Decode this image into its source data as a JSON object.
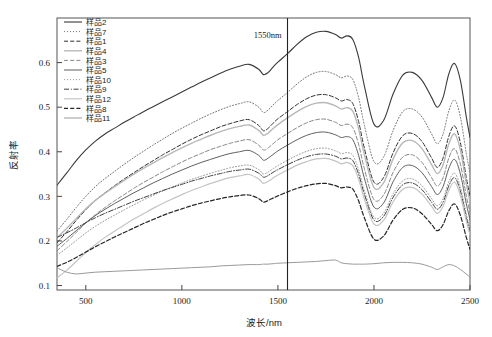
{
  "chart_data": {
    "type": "line",
    "title": "",
    "xlabel": "波长/nm",
    "ylabel": "反射率",
    "xlim": [
      350,
      2500
    ],
    "ylim": [
      0.09,
      0.7
    ],
    "xticks": [
      500,
      1000,
      1500,
      2000,
      2500
    ],
    "xtick_labels": [
      "500",
      "1000",
      "1500",
      "2000",
      "2500"
    ],
    "yticks": [
      0.1,
      0.2,
      0.3,
      0.4,
      0.5,
      0.6
    ],
    "ytick_labels": [
      "0.1",
      "0.2",
      "0.3",
      "0.4",
      "0.5",
      "0.6"
    ],
    "grid": false,
    "legend_position": "top-left",
    "annotations": [
      {
        "text": "1550nm",
        "x": 1550,
        "y": 0.655,
        "type": "vline-label"
      }
    ],
    "vlines": [
      {
        "x": 1550,
        "color": "#222222",
        "width": 1.1
      }
    ],
    "x": [
      350,
      400,
      450,
      500,
      550,
      600,
      650,
      700,
      750,
      800,
      850,
      900,
      950,
      1000,
      1050,
      1100,
      1150,
      1200,
      1250,
      1300,
      1350,
      1400,
      1425,
      1450,
      1475,
      1500,
      1550,
      1600,
      1650,
      1700,
      1750,
      1800,
      1830,
      1860,
      1890,
      1920,
      1950,
      2000,
      2050,
      2100,
      2150,
      2200,
      2250,
      2300,
      2330,
      2360,
      2390,
      2420,
      2450,
      2480,
      2500
    ],
    "series": [
      {
        "name": "样品2",
        "style": "solid",
        "color": "#3a3a3a",
        "width": 1.1,
        "values": [
          0.325,
          0.352,
          0.38,
          0.404,
          0.424,
          0.44,
          0.453,
          0.466,
          0.478,
          0.49,
          0.501,
          0.512,
          0.523,
          0.534,
          0.545,
          0.556,
          0.566,
          0.576,
          0.585,
          0.592,
          0.596,
          0.585,
          0.573,
          0.578,
          0.59,
          0.601,
          0.62,
          0.641,
          0.658,
          0.668,
          0.67,
          0.663,
          0.655,
          0.66,
          0.652,
          0.612,
          0.548,
          0.462,
          0.47,
          0.53,
          0.572,
          0.578,
          0.56,
          0.522,
          0.5,
          0.522,
          0.575,
          0.598,
          0.56,
          0.48,
          0.432
        ]
      },
      {
        "name": "样品7",
        "style": "dotted",
        "color": "#707070",
        "width": 1.0,
        "values": [
          0.222,
          0.248,
          0.275,
          0.3,
          0.322,
          0.34,
          0.356,
          0.372,
          0.387,
          0.401,
          0.415,
          0.428,
          0.441,
          0.453,
          0.464,
          0.475,
          0.485,
          0.494,
          0.502,
          0.508,
          0.512,
          0.5,
          0.488,
          0.494,
          0.505,
          0.515,
          0.533,
          0.552,
          0.568,
          0.578,
          0.58,
          0.573,
          0.566,
          0.57,
          0.562,
          0.522,
          0.46,
          0.378,
          0.388,
          0.448,
          0.49,
          0.496,
          0.478,
          0.44,
          0.418,
          0.44,
          0.492,
          0.516,
          0.478,
          0.398,
          0.352
        ]
      },
      {
        "name": "样品1",
        "style": "dashed",
        "color": "#2f2f2f",
        "width": 1.0,
        "values": [
          0.196,
          0.22,
          0.246,
          0.27,
          0.291,
          0.308,
          0.324,
          0.339,
          0.353,
          0.367,
          0.38,
          0.393,
          0.405,
          0.417,
          0.428,
          0.438,
          0.447,
          0.456,
          0.463,
          0.469,
          0.472,
          0.459,
          0.447,
          0.453,
          0.464,
          0.474,
          0.49,
          0.506,
          0.519,
          0.527,
          0.528,
          0.521,
          0.514,
          0.517,
          0.508,
          0.468,
          0.408,
          0.332,
          0.342,
          0.398,
          0.436,
          0.441,
          0.423,
          0.386,
          0.365,
          0.386,
          0.435,
          0.458,
          0.42,
          0.344,
          0.3
        ]
      },
      {
        "name": "样品4",
        "style": "light-solid",
        "color": "#b8b8b8",
        "width": 1.4,
        "values": [
          0.207,
          0.228,
          0.25,
          0.272,
          0.291,
          0.307,
          0.322,
          0.336,
          0.35,
          0.363,
          0.375,
          0.387,
          0.398,
          0.409,
          0.419,
          0.428,
          0.437,
          0.445,
          0.452,
          0.457,
          0.46,
          0.448,
          0.437,
          0.442,
          0.452,
          0.461,
          0.476,
          0.49,
          0.502,
          0.509,
          0.51,
          0.503,
          0.496,
          0.499,
          0.491,
          0.452,
          0.394,
          0.32,
          0.33,
          0.384,
          0.42,
          0.425,
          0.407,
          0.371,
          0.351,
          0.371,
          0.418,
          0.44,
          0.404,
          0.33,
          0.288
        ]
      },
      {
        "name": "样品3",
        "style": "dashed",
        "color": "#878787",
        "width": 1.0,
        "values": [
          0.178,
          0.198,
          0.219,
          0.24,
          0.259,
          0.275,
          0.29,
          0.304,
          0.318,
          0.331,
          0.343,
          0.355,
          0.366,
          0.377,
          0.387,
          0.396,
          0.405,
          0.412,
          0.419,
          0.424,
          0.427,
          0.415,
          0.404,
          0.409,
          0.418,
          0.427,
          0.441,
          0.454,
          0.465,
          0.472,
          0.473,
          0.466,
          0.459,
          0.462,
          0.454,
          0.417,
          0.362,
          0.293,
          0.303,
          0.354,
          0.388,
          0.393,
          0.376,
          0.342,
          0.323,
          0.342,
          0.386,
          0.407,
          0.372,
          0.303,
          0.264
        ]
      },
      {
        "name": "样品5",
        "style": "solid",
        "color": "#5f5f5f",
        "width": 1.0,
        "values": [
          0.188,
          0.205,
          0.223,
          0.241,
          0.257,
          0.271,
          0.284,
          0.296,
          0.308,
          0.319,
          0.33,
          0.34,
          0.35,
          0.359,
          0.368,
          0.376,
          0.383,
          0.39,
          0.396,
          0.4,
          0.403,
          0.392,
          0.381,
          0.386,
          0.394,
          0.402,
          0.415,
          0.427,
          0.437,
          0.443,
          0.444,
          0.438,
          0.432,
          0.434,
          0.427,
          0.392,
          0.341,
          0.276,
          0.285,
          0.333,
          0.365,
          0.369,
          0.353,
          0.322,
          0.304,
          0.322,
          0.363,
          0.383,
          0.35,
          0.285,
          0.248
        ]
      },
      {
        "name": "样品10",
        "style": "dotted",
        "color": "#999999",
        "width": 1.0,
        "values": [
          0.168,
          0.184,
          0.201,
          0.218,
          0.233,
          0.246,
          0.258,
          0.27,
          0.281,
          0.292,
          0.302,
          0.312,
          0.321,
          0.33,
          0.338,
          0.345,
          0.352,
          0.358,
          0.364,
          0.368,
          0.37,
          0.36,
          0.35,
          0.355,
          0.362,
          0.369,
          0.381,
          0.392,
          0.401,
          0.407,
          0.408,
          0.402,
          0.396,
          0.398,
          0.392,
          0.36,
          0.313,
          0.253,
          0.262,
          0.306,
          0.335,
          0.339,
          0.324,
          0.295,
          0.279,
          0.295,
          0.333,
          0.352,
          0.321,
          0.262,
          0.228
        ]
      },
      {
        "name": "样品9",
        "style": "dashdot",
        "color": "#3f3f3f",
        "width": 1.0,
        "values": [
          0.208,
          0.218,
          0.229,
          0.241,
          0.252,
          0.262,
          0.271,
          0.28,
          0.289,
          0.297,
          0.305,
          0.313,
          0.32,
          0.327,
          0.334,
          0.34,
          0.346,
          0.351,
          0.356,
          0.359,
          0.361,
          0.352,
          0.343,
          0.347,
          0.354,
          0.36,
          0.371,
          0.381,
          0.389,
          0.394,
          0.395,
          0.39,
          0.384,
          0.386,
          0.38,
          0.35,
          0.305,
          0.247,
          0.255,
          0.298,
          0.326,
          0.33,
          0.315,
          0.287,
          0.271,
          0.287,
          0.324,
          0.342,
          0.312,
          0.254,
          0.221
        ]
      },
      {
        "name": "样品12",
        "style": "light-solid",
        "color": "#c4c4c4",
        "width": 1.2,
        "values": [
          0.117,
          0.134,
          0.154,
          0.174,
          0.192,
          0.208,
          0.222,
          0.236,
          0.249,
          0.261,
          0.273,
          0.284,
          0.294,
          0.304,
          0.313,
          0.321,
          0.329,
          0.336,
          0.342,
          0.346,
          0.349,
          0.339,
          0.329,
          0.334,
          0.341,
          0.348,
          0.359,
          0.37,
          0.378,
          0.384,
          0.385,
          0.379,
          0.373,
          0.376,
          0.369,
          0.339,
          0.294,
          0.238,
          0.246,
          0.288,
          0.316,
          0.32,
          0.305,
          0.278,
          0.262,
          0.278,
          0.314,
          0.332,
          0.302,
          0.246,
          0.214
        ]
      },
      {
        "name": "样品8",
        "style": "dashed",
        "color": "#252525",
        "width": 1.2,
        "values": [
          0.143,
          0.152,
          0.163,
          0.175,
          0.187,
          0.198,
          0.209,
          0.219,
          0.229,
          0.239,
          0.248,
          0.257,
          0.265,
          0.272,
          0.279,
          0.285,
          0.29,
          0.295,
          0.299,
          0.302,
          0.303,
          0.295,
          0.287,
          0.291,
          0.296,
          0.301,
          0.31,
          0.318,
          0.324,
          0.328,
          0.329,
          0.324,
          0.319,
          0.321,
          0.316,
          0.29,
          0.252,
          0.204,
          0.211,
          0.247,
          0.271,
          0.274,
          0.261,
          0.237,
          0.223,
          0.237,
          0.268,
          0.283,
          0.257,
          0.209,
          0.181
        ]
      },
      {
        "name": "样品11",
        "style": "solid",
        "color": "#9a9a9a",
        "width": 1.0,
        "values": [
          0.14,
          0.13,
          0.126,
          0.128,
          0.13,
          0.131,
          0.132,
          0.133,
          0.134,
          0.135,
          0.136,
          0.137,
          0.138,
          0.139,
          0.14,
          0.141,
          0.142,
          0.144,
          0.145,
          0.146,
          0.147,
          0.147,
          0.148,
          0.148,
          0.149,
          0.15,
          0.151,
          0.152,
          0.153,
          0.154,
          0.156,
          0.157,
          0.151,
          0.149,
          0.148,
          0.148,
          0.148,
          0.149,
          0.151,
          0.152,
          0.152,
          0.151,
          0.148,
          0.141,
          0.136,
          0.142,
          0.147,
          0.144,
          0.136,
          0.126,
          0.119
        ]
      }
    ]
  },
  "legend": {
    "items": [
      {
        "label": "样品2"
      },
      {
        "label": "样品7"
      },
      {
        "label": "样品1"
      },
      {
        "label": "样品4"
      },
      {
        "label": "样品3"
      },
      {
        "label": "样品5"
      },
      {
        "label": "样品10"
      },
      {
        "label": "样品9"
      },
      {
        "label": "样品12"
      },
      {
        "label": "样品8"
      },
      {
        "label": "样品11"
      }
    ]
  }
}
